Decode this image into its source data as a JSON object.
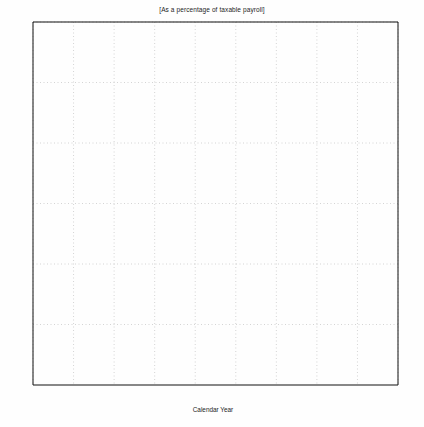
{
  "chart_data": {
    "type": "line",
    "title": "[As a percentage of taxable payroll]",
    "xlabel": "Calendar Year",
    "ylabel": "",
    "xlim": [
      1980,
      2070
    ],
    "ylim": [
      0,
      30
    ],
    "xticks": [
      1980,
      1990,
      2000,
      2010,
      2020,
      2030,
      2040,
      2050,
      2060,
      2070
    ],
    "yticks": [
      0,
      5,
      10,
      15,
      20,
      25,
      30
    ],
    "ytick_labels": [
      "0",
      "5",
      "10",
      "15",
      "20",
      "25",
      "30 %"
    ],
    "xtick_labels": [
      "1980",
      "1990",
      "2000",
      "2010",
      "2020",
      "2030",
      "2040",
      "2050",
      "2060",
      "2070"
    ],
    "grid": true,
    "minor_ticks": true,
    "legend_position": "bottom-right",
    "legend": [
      {
        "name": "Income rates",
        "style": "dotted"
      },
      {
        "name": "Cost rates",
        "style": "solid"
      }
    ],
    "series": [
      {
        "name": "Income rates",
        "label": "",
        "style": "dotted",
        "x": [
          1990,
          1991,
          1993,
          1994,
          2000,
          2010,
          2020,
          2030,
          2040,
          2050,
          2060,
          2065
        ],
        "values": [
          12.4,
          12.4,
          12.5,
          13.0,
          13.0,
          13.0,
          13.0,
          13.0,
          13.0,
          13.0,
          13.0,
          13.0
        ]
      },
      {
        "name": "Cost rate - Alternative I",
        "label": "I",
        "style": "solid",
        "x": [
          1990,
          1995,
          2000,
          2005,
          2010,
          2015,
          2020,
          2025,
          2030,
          2035,
          2040,
          2045,
          2050,
          2055,
          2060,
          2065
        ],
        "values": [
          10.6,
          10.2,
          9.7,
          9.3,
          9.4,
          10.1,
          11.2,
          12.3,
          12.9,
          13.0,
          12.7,
          12.3,
          12.0,
          11.8,
          11.6,
          11.5
        ]
      },
      {
        "name": "Cost rate - Alternative II-A",
        "label": "II-A",
        "style": "solid",
        "x": [
          1990,
          1995,
          2000,
          2005,
          2010,
          2015,
          2020,
          2025,
          2030,
          2035,
          2040,
          2045,
          2050,
          2055,
          2060,
          2065
        ],
        "values": [
          10.6,
          10.4,
          10.2,
          10.3,
          10.9,
          11.9,
          13.2,
          14.5,
          15.5,
          16.0,
          16.1,
          16.1,
          16.1,
          16.2,
          16.4,
          16.6
        ]
      },
      {
        "name": "Cost rate - Alternative II-B",
        "label": "II-B",
        "style": "solid",
        "x": [
          1990,
          1995,
          2000,
          2005,
          2010,
          2015,
          2020,
          2025,
          2030,
          2035,
          2040,
          2045,
          2050,
          2055,
          2060,
          2065
        ],
        "values": [
          10.6,
          10.5,
          10.4,
          10.6,
          11.3,
          12.4,
          13.8,
          15.2,
          16.2,
          16.7,
          16.8,
          16.8,
          16.8,
          16.9,
          17.1,
          17.3
        ]
      },
      {
        "name": "Cost rate - Alternative III",
        "label": "II",
        "style": "solid",
        "x": [
          1990,
          1995,
          2000,
          2005,
          2010,
          2015,
          2020,
          2025,
          2030,
          2035,
          2040,
          2045,
          2050,
          2055,
          2060,
          2065
        ],
        "values": [
          10.7,
          10.8,
          11.0,
          11.6,
          12.8,
          14.5,
          16.5,
          18.5,
          20.3,
          21.6,
          22.5,
          23.2,
          23.9,
          24.6,
          25.4,
          26.0
        ]
      }
    ]
  },
  "axis": {
    "x_title": "Calendar Year",
    "y_unit": "30 %"
  }
}
